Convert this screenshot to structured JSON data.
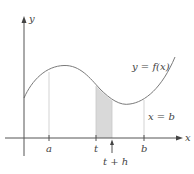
{
  "diagram": {
    "type": "area-under-curve",
    "axes": {
      "x_label": "x",
      "y_label": "y"
    },
    "curve_label": "y = f(x)",
    "boundary_label": "x = b",
    "ticks": [
      {
        "id": "a",
        "label": "a"
      },
      {
        "id": "t",
        "label": "t"
      },
      {
        "id": "b",
        "label": "b"
      }
    ],
    "pointer_label": "t + h",
    "shaded_region": {
      "from": "t",
      "to": "t + h",
      "fill": "#d9d9d9"
    },
    "colors": {
      "axis": "#555555",
      "curve": "#7a7a7a",
      "guide": "#c8c8c8",
      "text": "#444444"
    }
  }
}
